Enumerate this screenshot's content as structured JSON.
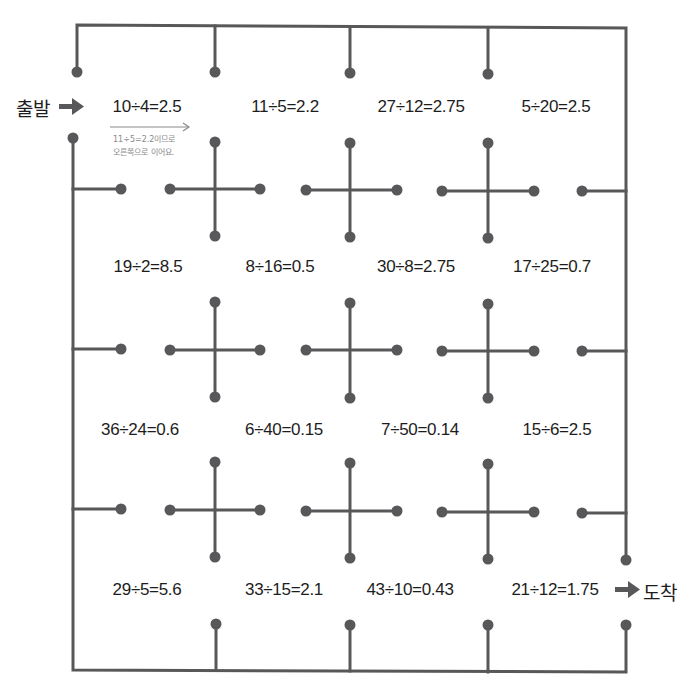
{
  "start_label": "출발",
  "end_label": "도착",
  "colors": {
    "line": "#58585a",
    "dot": "#58585a",
    "text": "#1d1d1d",
    "hint": "#8a8a8a"
  },
  "hint": {
    "line1": "11÷5=2.2이므로",
    "line2": "오른쪽으로 이어요."
  },
  "rows": [
    {
      "equations": [
        "10÷4=2.5",
        "11÷5=2.2",
        "27÷12=2.75",
        "5÷20=2.5"
      ]
    },
    {
      "equations": [
        "19÷2=8.5",
        "8÷16=0.5",
        "30÷8=2.75",
        "17÷25=0.7"
      ]
    },
    {
      "equations": [
        "36÷24=0.6",
        "6÷40=0.15",
        "7÷50=0.14",
        "15÷6=2.5"
      ]
    },
    {
      "equations": [
        "29÷5=5.6",
        "33÷15=2.1",
        "43÷10=0.43",
        "21÷12=1.75"
      ]
    }
  ]
}
